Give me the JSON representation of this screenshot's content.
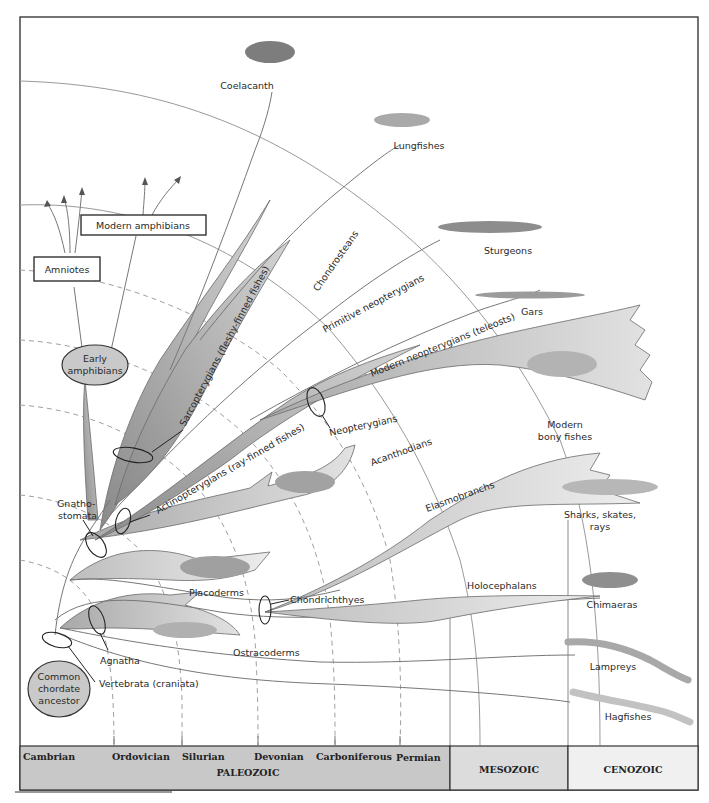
{
  "diagram": {
    "root": "Common chordate ancestor",
    "clades": {
      "vertebrata": "Vertebrata (craniata)",
      "agnatha": "Agnatha",
      "gnathostomata_line1": "Gnatho-",
      "gnathostomata_line2": "stomata",
      "chondrichthyes": "Chondrichthyes",
      "actinopterygians": "Actinopterygians (ray-finned fishes)",
      "sarcopterygians": "Sarcopterygians (fleshy-finned fishes)",
      "neopterygians": "Neopterygians"
    },
    "lineages": {
      "ostracoderms": "Ostracoderms",
      "placoderms": "Placoderms",
      "acanthodians": "Acanthodians",
      "elasmobranchs": "Elasmobranchs",
      "holocephalans": "Holocephalans",
      "chondrosteans": "Chondrosteans",
      "primitive_neopterygians": "Primitive neopterygians",
      "modern_neopterygians": "Modern neopterygians (teleosts)",
      "early_amphibians_line1": "Early",
      "early_amphibians_line2": "amphibians"
    },
    "living_groups": {
      "coelacanth": "Coelacanth",
      "lungfishes": "Lungfishes",
      "sturgeons": "Sturgeons",
      "gars": "Gars",
      "modern_bony_fishes_line1": "Modern",
      "modern_bony_fishes_line2": "bony fishes",
      "sharks_line1": "Sharks, skates,",
      "sharks_line2": "rays",
      "chimaeras": "Chimaeras",
      "lampreys": "Lampreys",
      "hagfishes": "Hagfishes",
      "modern_amphibians": "Modern amphibians",
      "amniotes": "Amniotes"
    },
    "root_label": [
      "Common",
      "chordate",
      "ancestor"
    ],
    "timescale": {
      "periods": [
        "Cambrian",
        "Ordovician",
        "Silurian",
        "Devonian",
        "Carboniferous",
        "Permian"
      ],
      "eras": {
        "paleozoic": "PALEOZOIC",
        "mesozoic": "MESOZOIC",
        "cenozoic": "CENOZOIC"
      },
      "colors": {
        "paleozoic": "#c8c8c8",
        "mesozoic": "#dcdcdc",
        "cenozoic": "#f0f0f0"
      }
    },
    "colors": {
      "wedge_dark": "#9c9c9c",
      "wedge_mid": "#b9b9b9",
      "wedge_light": "#dadada",
      "fish_body": "#8e8e8e"
    }
  }
}
